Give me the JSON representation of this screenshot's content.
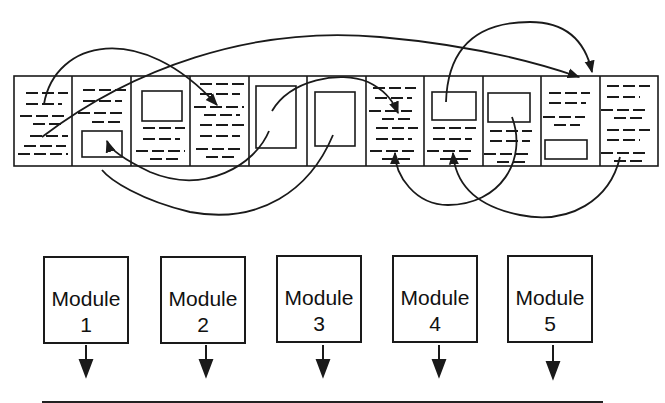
{
  "header": {
    "cut_text": ""
  },
  "page_strip": {
    "panel_count": 11,
    "x": 14,
    "y": 76,
    "width": 644,
    "height": 90,
    "panels": [
      {
        "index": 1,
        "content": "text"
      },
      {
        "index": 2,
        "content": "text-with-figure-bottom"
      },
      {
        "index": 3,
        "content": "figure-top-with-text"
      },
      {
        "index": 4,
        "content": "text"
      },
      {
        "index": 5,
        "content": "tall-figure"
      },
      {
        "index": 6,
        "content": "tall-figure"
      },
      {
        "index": 7,
        "content": "text"
      },
      {
        "index": 8,
        "content": "figure-top-with-text"
      },
      {
        "index": 9,
        "content": "figure-top-with-text"
      },
      {
        "index": 10,
        "content": "text-with-figure-bottom"
      },
      {
        "index": 11,
        "content": "text"
      }
    ]
  },
  "modules": [
    {
      "title": "Module",
      "number": "1"
    },
    {
      "title": "Module",
      "number": "2"
    },
    {
      "title": "Module",
      "number": "3"
    },
    {
      "title": "Module",
      "number": "4"
    },
    {
      "title": "Module",
      "number": "5"
    }
  ],
  "colors": {
    "stroke": "#1a1a1a",
    "background": "#ffffff"
  }
}
